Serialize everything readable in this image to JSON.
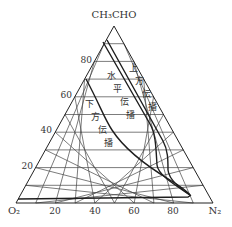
{
  "diagram": {
    "type": "ternary",
    "vertices": {
      "top": "CH₃CHO",
      "left": "O₂",
      "right": "N₂"
    },
    "left_axis_ticks": [
      "20",
      "40",
      "60",
      "80"
    ],
    "bottom_axis_ticks": [
      "20",
      "40",
      "60",
      "80"
    ],
    "grid_step_percent": 10,
    "regions": [
      {
        "name": "upward-propagation",
        "label": "上方伝播"
      },
      {
        "name": "horizontal-propagation",
        "label": "水平伝播"
      },
      {
        "name": "downward-propagation",
        "label": "下方伝播"
      }
    ],
    "colors": {
      "grid": "#333333",
      "curve": "#222222",
      "text": "#333333",
      "background": "#ffffff"
    }
  }
}
